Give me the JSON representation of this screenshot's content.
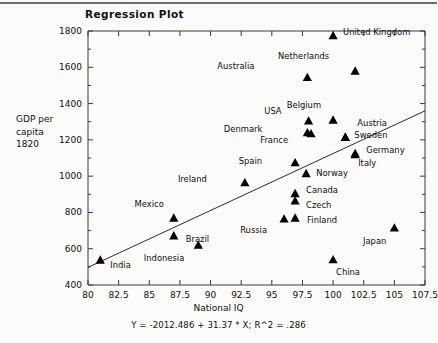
{
  "title": "Regression Plot",
  "chart_data": {
    "type": "scatter",
    "title": "Regression Plot",
    "xlabel": "National IQ",
    "ylabel": "GDP per capita 1820",
    "ylabel_lines": [
      "GDP per",
      "capita",
      "1820"
    ],
    "xlim": [
      80,
      107.5
    ],
    "ylim": [
      400,
      1800
    ],
    "xticks": [
      "80",
      "82.5",
      "85",
      "87.5",
      "90",
      "92.5",
      "95",
      "97.5",
      "100",
      "102.5",
      "105",
      "107.5"
    ],
    "xtick_values": [
      80,
      82.5,
      85,
      87.5,
      90,
      92.5,
      95,
      97.5,
      100,
      102.5,
      105,
      107.5
    ],
    "yticks": [
      "400",
      "600",
      "800",
      "1000",
      "1200",
      "1400",
      "1600",
      "1800"
    ],
    "ytick_values": [
      400,
      600,
      800,
      1000,
      1200,
      1400,
      1600,
      1800
    ],
    "grid": false,
    "legend": "none",
    "marker": "triangle",
    "marker_color": "#000000",
    "annotation": "Y = -2012.486 + 31.37 * X; R^2 = .286",
    "regression": {
      "intercept": -2012.486,
      "slope": 31.37,
      "r_squared": 0.286,
      "equation": "Y = -2012.486 + 31.37 * X; R^2 = .286",
      "x_start": 80,
      "y_start": 497,
      "x_end": 107.5,
      "y_end": 1360
    },
    "points": [
      {
        "label": "United Kingdom",
        "x": 100.0,
        "y": 1775,
        "lx": 10,
        "ly": -4
      },
      {
        "label": "Netherlands",
        "x": 101.8,
        "y": 1580,
        "lx": -26,
        "ly": -15
      },
      {
        "label": "Australia",
        "x": 97.9,
        "y": 1545,
        "lx": -53,
        "ly": -11
      },
      {
        "label": "Belgium",
        "x": 100.0,
        "y": 1310,
        "lx": -12,
        "ly": -15
      },
      {
        "label": "USA",
        "x": 98.0,
        "y": 1305,
        "lx": -27,
        "ly": -10
      },
      {
        "label": "Austria",
        "x": 101.0,
        "y": 1215,
        "lx": 12,
        "ly": -14
      },
      {
        "label": "Sweden",
        "x": 101.0,
        "y": 1215,
        "lx": 9,
        "ly": -2
      },
      {
        "label": "Denmark",
        "x": 97.9,
        "y": 1240,
        "lx": -45,
        "ly": -4
      },
      {
        "label": "France",
        "x": 98.2,
        "y": 1235,
        "lx": -23,
        "ly": 6
      },
      {
        "label": "Germany",
        "x": 101.8,
        "y": 1125,
        "lx": 11,
        "ly": -3
      },
      {
        "label": "Italy",
        "x": 101.8,
        "y": 1120,
        "lx": 3,
        "ly": 9
      },
      {
        "label": "Spain",
        "x": 96.9,
        "y": 1075,
        "lx": -33,
        "ly": -2
      },
      {
        "label": "Norway",
        "x": 97.8,
        "y": 1015,
        "lx": 10,
        "ly": 0
      },
      {
        "label": "Ireland",
        "x": 92.8,
        "y": 965,
        "lx": -38,
        "ly": -3
      },
      {
        "label": "Canada",
        "x": 96.9,
        "y": 905,
        "lx": 11,
        "ly": -3
      },
      {
        "label": "Czech",
        "x": 96.9,
        "y": 865,
        "lx": 11,
        "ly": 4
      },
      {
        "label": "Mexico",
        "x": 87.0,
        "y": 770,
        "lx": -10,
        "ly": -14
      },
      {
        "label": "Finland",
        "x": 96.9,
        "y": 770,
        "lx": 12,
        "ly": 2
      },
      {
        "label": "Russia",
        "x": 96.0,
        "y": 765,
        "lx": -17,
        "ly": 11
      },
      {
        "label": "Japan",
        "x": 105.0,
        "y": 715,
        "lx": -8,
        "ly": 13
      },
      {
        "label": "Brazil",
        "x": 87.0,
        "y": 672,
        "lx": 12,
        "ly": 3
      },
      {
        "label": "Indonesia",
        "x": 89.0,
        "y": 620,
        "lx": -14,
        "ly": 13
      },
      {
        "label": "China",
        "x": 100.0,
        "y": 540,
        "lx": 3,
        "ly": 12
      },
      {
        "label": "India",
        "x": 81.0,
        "y": 538,
        "lx": 10,
        "ly": 5
      }
    ]
  }
}
